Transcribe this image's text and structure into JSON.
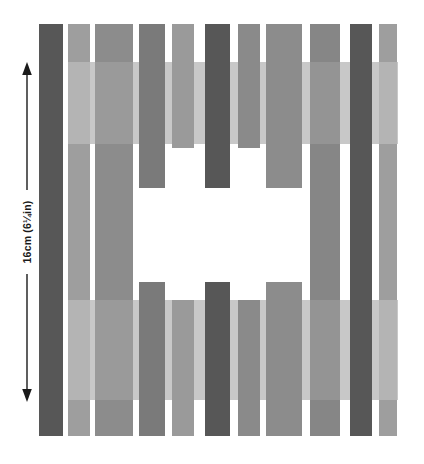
{
  "figure": {
    "background_color": "#ffffff",
    "width": 424,
    "height": 464
  },
  "annotation": {
    "dimension_label": "16cm (6¼in)",
    "dimension_value": "16",
    "dimension_unit": "cm",
    "dimension_imperial": "6¼in",
    "arrow_color": "#1a1a1a",
    "text_color": "#1a1a1a",
    "orientation": "vertical",
    "arrow_heads": "both"
  },
  "palette": {
    "dark_gray": "#575757",
    "mid_gray": "#808080",
    "medium_gray": "#8c8c8c",
    "light_gray": "#9c9c9c",
    "pale_gray": "#b3b3b3",
    "paler_gray": "#c2c2c2",
    "white": "#ffffff"
  },
  "stripes": [
    {
      "name": "stripe-1",
      "x": 39,
      "y": 24,
      "w": 24,
      "h": 412,
      "color": "#575757"
    },
    {
      "name": "stripe-2",
      "x": 68,
      "y": 24,
      "w": 22,
      "h": 412,
      "color": "#9c9c9c"
    },
    {
      "name": "stripe-2-band-upper",
      "x": 68,
      "y": 62,
      "w": 22,
      "h": 82,
      "color": "#b0b0b0"
    },
    {
      "name": "stripe-2-band-lower",
      "x": 68,
      "y": 300,
      "w": 22,
      "h": 100,
      "color": "#b0b0b0"
    },
    {
      "name": "stripe-3",
      "x": 95,
      "y": 24,
      "w": 38,
      "h": 412,
      "color": "#8c8c8c"
    },
    {
      "name": "stripe-4",
      "x": 139,
      "y": 24,
      "w": 26,
      "h": 164,
      "color": "#777777"
    },
    {
      "name": "stripe-4-lower",
      "x": 139,
      "y": 282,
      "w": 26,
      "h": 154,
      "color": "#777777"
    },
    {
      "name": "stripe-5",
      "x": 172,
      "y": 24,
      "w": 22,
      "h": 124,
      "color": "#9a9a9a"
    },
    {
      "name": "stripe-5-lower",
      "x": 172,
      "y": 300,
      "w": 22,
      "h": 136,
      "color": "#9a9a9a"
    },
    {
      "name": "stripe-6",
      "x": 205,
      "y": 24,
      "w": 25,
      "h": 164,
      "color": "#575757"
    },
    {
      "name": "stripe-6-lower",
      "x": 205,
      "y": 282,
      "w": 25,
      "h": 154,
      "color": "#575757"
    },
    {
      "name": "stripe-7",
      "x": 238,
      "y": 24,
      "w": 22,
      "h": 124,
      "color": "#8a8a8a"
    },
    {
      "name": "stripe-7-lower",
      "x": 238,
      "y": 300,
      "w": 22,
      "h": 136,
      "color": "#8a8a8a"
    },
    {
      "name": "stripe-8",
      "x": 266,
      "y": 24,
      "w": 36,
      "h": 164,
      "color": "#8c8c8c"
    },
    {
      "name": "stripe-8-lower",
      "x": 266,
      "y": 282,
      "w": 36,
      "h": 154,
      "color": "#8c8c8c"
    },
    {
      "name": "stripe-9",
      "x": 310,
      "y": 24,
      "w": 30,
      "h": 412,
      "color": "#808080"
    },
    {
      "name": "stripe-10",
      "x": 350,
      "y": 24,
      "w": 22,
      "h": 412,
      "color": "#575757"
    },
    {
      "name": "stripe-11",
      "x": 379,
      "y": 24,
      "w": 18,
      "h": 412,
      "color": "#9c9c9c"
    },
    {
      "name": "band-upper-pale",
      "x": 139,
      "y": 62,
      "w": 175,
      "h": 82,
      "color": "#c2c2c2"
    },
    {
      "name": "band-lower-pale",
      "x": 139,
      "y": 300,
      "w": 175,
      "h": 100,
      "color": "#c2c2c2"
    },
    {
      "name": "band-right-upper-pale",
      "x": 340,
      "y": 62,
      "w": 57,
      "h": 82,
      "color": "#c2c2c2"
    },
    {
      "name": "band-right-lower-pale",
      "x": 340,
      "y": 300,
      "w": 57,
      "h": 100,
      "color": "#c2c2c2"
    }
  ]
}
